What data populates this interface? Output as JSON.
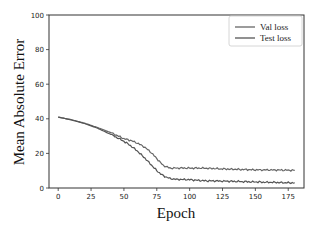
{
  "chart_data": {
    "type": "line",
    "title": "",
    "xlabel": "Epoch",
    "ylabel": "Mean Absolute Error",
    "xlim": [
      -7,
      187
    ],
    "ylim": [
      0,
      100
    ],
    "xticks": [
      0,
      25,
      50,
      75,
      100,
      125,
      150,
      175
    ],
    "yticks": [
      0,
      20,
      40,
      60,
      80,
      100
    ],
    "grid": false,
    "legend_position": "upper right",
    "series": [
      {
        "name": "Val loss",
        "color": "#666666",
        "x": [
          0,
          10,
          20,
          30,
          40,
          50,
          55,
          60,
          65,
          70,
          75,
          80,
          85,
          90,
          100,
          110,
          125,
          150,
          175,
          180
        ],
        "values": [
          41,
          39.5,
          37.5,
          35,
          32,
          28.5,
          27.5,
          26,
          24,
          21,
          17,
          13,
          11.5,
          11.5,
          11.5,
          11.5,
          11,
          10.5,
          10.3,
          10.2
        ]
      },
      {
        "name": "Test loss",
        "color": "#555555",
        "x": [
          0,
          10,
          20,
          30,
          40,
          50,
          55,
          60,
          65,
          70,
          75,
          80,
          85,
          90,
          100,
          110,
          125,
          150,
          175,
          180
        ],
        "values": [
          41,
          39.3,
          37.3,
          34.5,
          31,
          27,
          24.5,
          21.5,
          18,
          14,
          10,
          7,
          5.5,
          5,
          4.8,
          4.2,
          4,
          3.5,
          3,
          3
        ]
      }
    ]
  },
  "legend": {
    "items": [
      "Val loss",
      "Test loss"
    ]
  },
  "axes": {
    "xlabel": "Epoch",
    "ylabel": "Mean Absolute Error",
    "xtick_labels": [
      "0",
      "25",
      "50",
      "75",
      "100",
      "125",
      "150",
      "175"
    ],
    "ytick_labels": [
      "0",
      "20",
      "40",
      "60",
      "80",
      "100"
    ]
  }
}
